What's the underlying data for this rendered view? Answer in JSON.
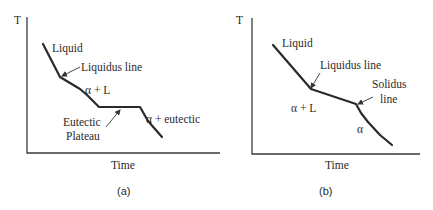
{
  "panels": [
    {
      "id": "a",
      "caption": "(a)",
      "y_axis_label": "T",
      "x_axis_label": "Time",
      "labels": {
        "liquid": "Liquid",
        "liquidus_line": "Liquidus line",
        "alpha_plus_l": "α + L",
        "eutectic_1": "Eutectic",
        "eutectic_2": "Plateau",
        "alpha_plus_eutectic": "α + eutectic"
      }
    },
    {
      "id": "b",
      "caption": "(b)",
      "y_axis_label": "T",
      "x_axis_label": "Time",
      "labels": {
        "liquid": "Liquid",
        "liquidus_line": "Liquidus line",
        "solidus_1": "Solidus",
        "solidus_2": "line",
        "alpha_plus_l": "α + L",
        "alpha": "α"
      }
    }
  ]
}
